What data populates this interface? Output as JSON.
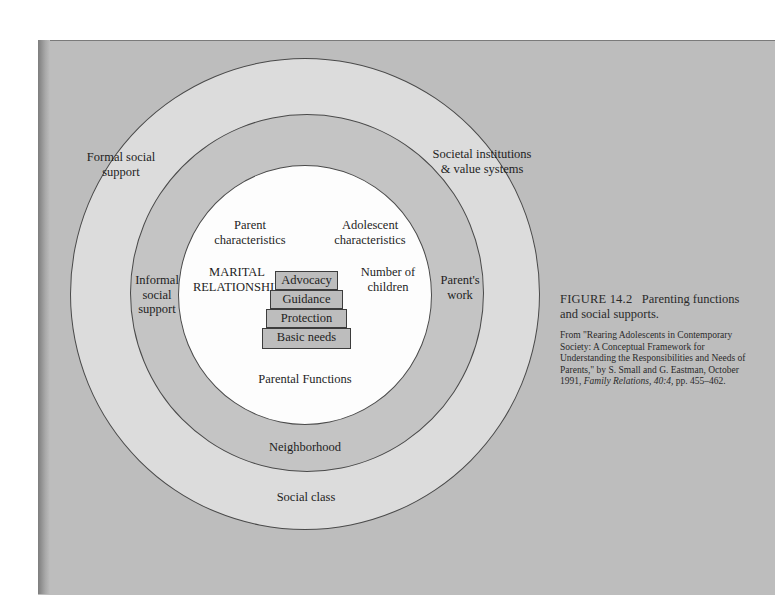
{
  "figure": {
    "number_label": "FIGURE 14.2",
    "title": "Parenting functions and social supports.",
    "source_prefix": "From \"Rearing Adolescents in Contemporary Society: A Conceptual Framework for Understanding the Responsibilities and Needs of Parents,\" by S. Small and G. Eastman, October 1991,",
    "source_journal": "Family Relations, 40:4,",
    "source_pages": "pp. 455–462."
  },
  "diagram": {
    "outer_ring": {
      "labels": {
        "top_left": "Formal social support",
        "top_right": "Societal institutions & value systems",
        "bottom": "Social class"
      }
    },
    "middle_ring": {
      "labels": {
        "left": "Informal social support",
        "right": "Parent's work",
        "bottom": "Neighborhood"
      }
    },
    "inner_circle": {
      "labels": {
        "parent": "Parent characteristics",
        "adolescent": "Adolescent characteristics",
        "marital_line1": "MARITAL",
        "marital_line2": "RELATIONSHIP",
        "children": "Number of children",
        "functions": "Parental Functions"
      },
      "pyramid": [
        "Advocacy",
        "Guidance",
        "Protection",
        "Basic needs"
      ]
    },
    "colors": {
      "page_bg": "#bdbdbd",
      "outer_ring": "#dcdcdc",
      "middle_ring": "#c4c4c4",
      "inner_circle": "#fdfdfd",
      "pyramid_step": "#bdbdbd"
    }
  }
}
